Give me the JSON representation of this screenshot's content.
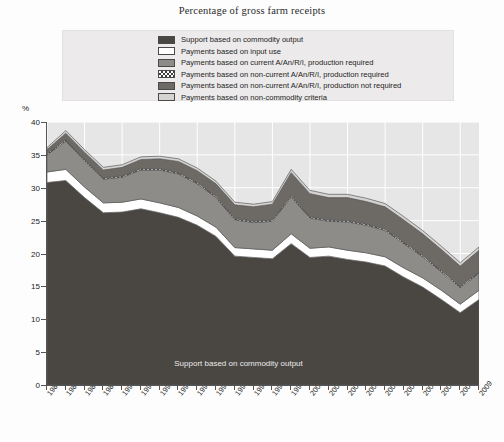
{
  "chart": {
    "title": "Percentage of gross farm receipts",
    "y_axis_unit": "%",
    "annotation": "Support based on commodity output"
  },
  "legend": {
    "items": [
      {
        "label": "Support based on commodity output",
        "swatch": "dark-gray-solid",
        "color": "#4a4743"
      },
      {
        "label": "Payments based on input use",
        "swatch": "white-solid",
        "color": "#ffffff"
      },
      {
        "label": "Payments based on current A/An/R/I, production required",
        "swatch": "medium-gray-solid",
        "color": "#8d8c88"
      },
      {
        "label": "Payments based on non-current A/An/R/I, production required",
        "swatch": "checkerboard",
        "color": "#3d3d3d"
      },
      {
        "label": "Payments based on non-current A/An/R/I, production not required",
        "swatch": "dark-medium-gray-solid",
        "color": "#6d6a66"
      },
      {
        "label": "Payments based on non-commodity criteria",
        "swatch": "light-gray-solid",
        "color": "#d5d4d2"
      }
    ]
  },
  "chart_data": {
    "type": "area",
    "title": "Percentage of gross farm receipts",
    "xlabel": "",
    "ylabel": "%",
    "ylim": [
      0,
      40
    ],
    "yticks": [
      0,
      5,
      10,
      15,
      20,
      25,
      30,
      35,
      40
    ],
    "grid": true,
    "legend_position": "top",
    "stacked": true,
    "categories": [
      "1986",
      "1987",
      "1988",
      "1989",
      "1990",
      "1991",
      "1992",
      "1993",
      "1994",
      "1995",
      "1996",
      "1997",
      "1998",
      "1999",
      "2000",
      "2001",
      "2002",
      "2003",
      "2004",
      "2005",
      "2006",
      "2007",
      "2008",
      "2009"
    ],
    "series": [
      {
        "name": "Support based on commodity output",
        "color": "#4a4743",
        "values": [
          30.8,
          31.1,
          28.5,
          26.2,
          26.3,
          26.8,
          26.2,
          25.5,
          24.3,
          22.6,
          19.6,
          19.4,
          19.2,
          21.5,
          19.4,
          19.6,
          19.1,
          18.7,
          18.1,
          16.4,
          14.9,
          13.0,
          11.0,
          13.0
        ]
      },
      {
        "name": "Payments based on input use",
        "color": "#ffffff",
        "values": [
          1.6,
          1.7,
          1.6,
          1.5,
          1.5,
          1.5,
          1.5,
          1.5,
          1.4,
          1.4,
          1.3,
          1.3,
          1.3,
          1.5,
          1.4,
          1.4,
          1.4,
          1.4,
          1.4,
          1.4,
          1.4,
          1.4,
          1.3,
          1.4
        ]
      },
      {
        "name": "Payments based on current A/An/R/I, production required",
        "color": "#8d8c88",
        "values": [
          2.6,
          4.3,
          4.0,
          3.6,
          3.8,
          4.4,
          5.0,
          5.1,
          4.9,
          4.5,
          4.2,
          4.0,
          4.4,
          5.6,
          4.6,
          3.9,
          4.3,
          4.2,
          4.0,
          3.7,
          3.2,
          2.8,
          2.5,
          2.6
        ]
      },
      {
        "name": "Payments based on non-current A/An/R/I, production required",
        "color": "#3d3d3d",
        "values": [
          0.2,
          0.2,
          0.2,
          0.2,
          0.2,
          0.2,
          0.2,
          0.2,
          0.2,
          0.2,
          0.2,
          0.2,
          0.2,
          0.2,
          0.2,
          0.2,
          0.2,
          0.2,
          0.2,
          0.2,
          0.2,
          0.2,
          0.2,
          0.2
        ]
      },
      {
        "name": "Payments based on non-current A/An/R/I, production not required",
        "color": "#6d6a66",
        "values": [
          0.6,
          1.0,
          1.1,
          1.2,
          1.3,
          1.4,
          1.5,
          1.7,
          1.8,
          1.9,
          2.1,
          2.2,
          2.4,
          3.5,
          3.5,
          3.4,
          3.5,
          3.4,
          3.4,
          3.4,
          3.3,
          3.2,
          3.1,
          3.3
        ]
      },
      {
        "name": "Payments based on non-commodity criteria",
        "color": "#d5d4d2",
        "values": [
          0.3,
          0.4,
          0.4,
          0.4,
          0.4,
          0.4,
          0.4,
          0.4,
          0.4,
          0.4,
          0.4,
          0.4,
          0.4,
          0.5,
          0.5,
          0.5,
          0.5,
          0.5,
          0.5,
          0.5,
          0.5,
          0.5,
          0.5,
          0.5
        ]
      }
    ],
    "totals": [
      36.1,
      38.7,
      35.8,
      33.1,
      33.5,
      34.7,
      34.8,
      34.4,
      33.0,
      31.0,
      27.8,
      27.5,
      27.9,
      32.8,
      29.6,
      29.0,
      29.0,
      28.4,
      27.6,
      25.6,
      23.5,
      21.1,
      18.6,
      21.0
    ]
  }
}
